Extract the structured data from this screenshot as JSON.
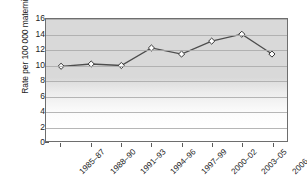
{
  "chart_data": {
    "type": "line",
    "title": "",
    "xlabel": "",
    "ylabel": "Rate per 100 000 maternities",
    "categories": [
      "1985–87",
      "1988–90",
      "1991–93",
      "1994–96",
      "1997–99",
      "2000–02",
      "2003–05",
      "2006–08"
    ],
    "values": [
      9.8,
      10.1,
      9.9,
      12.2,
      11.4,
      13.1,
      14.0,
      11.4
    ],
    "ylim": [
      0,
      16
    ],
    "ytick_labels": [
      "0",
      "2",
      "4",
      "6",
      "8",
      "10",
      "12",
      "14",
      "16"
    ],
    "ytick_values": [
      0,
      2,
      4,
      6,
      8,
      10,
      12,
      14,
      16
    ],
    "grid": "horizontal",
    "legend": "none",
    "marker": "diamond",
    "colors": {
      "line": "#4d4d4d",
      "marker_fill": "#ffffff",
      "marker_edge": "#333333",
      "plot_background": "#d9d9d9",
      "gridline": "#a9a9a9",
      "axis": "#6e6e6e",
      "text": "#1d1d1d"
    }
  }
}
